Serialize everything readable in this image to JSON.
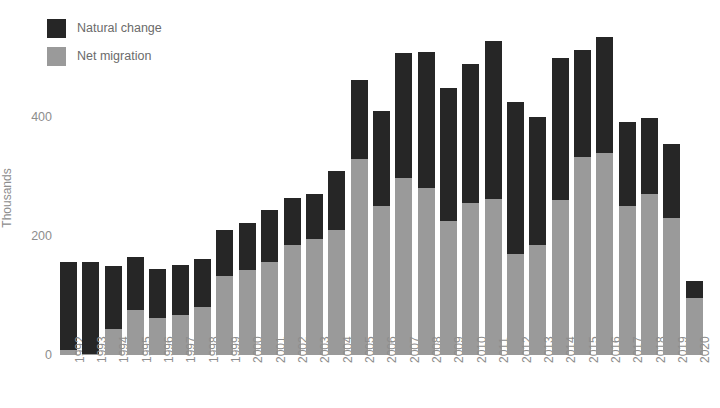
{
  "chart_data": {
    "type": "bar",
    "stacked": true,
    "title": "",
    "xlabel": "",
    "ylabel": "Thousands",
    "ylim": [
      0,
      560
    ],
    "yticks": [
      0,
      200,
      400
    ],
    "ytick_labels": [
      "0",
      "200",
      "400"
    ],
    "grid": false,
    "legend_position": "top-left",
    "categories": [
      "1992",
      "1993",
      "1994",
      "1995",
      "1996",
      "1997",
      "1998",
      "1999",
      "2000",
      "2001",
      "2002",
      "2003",
      "2004",
      "2005",
      "2006",
      "2007",
      "2008",
      "2009",
      "2010",
      "2011",
      "2012",
      "2013",
      "2014",
      "2015",
      "2016",
      "2017",
      "2018",
      "2019",
      "2020"
    ],
    "series": [
      {
        "name": "Net migration",
        "color": "#9a9a9a",
        "values": [
          8,
          2,
          44,
          76,
          62,
          68,
          80,
          133,
          143,
          156,
          185,
          195,
          210,
          330,
          250,
          298,
          280,
          226,
          256,
          262,
          170,
          185,
          260,
          332,
          340,
          250,
          270,
          230,
          95
        ]
      },
      {
        "name": "Natural change",
        "color": "#262626",
        "values": [
          149,
          155,
          105,
          89,
          82,
          83,
          82,
          77,
          79,
          87,
          79,
          75,
          100,
          132,
          160,
          210,
          230,
          222,
          233,
          265,
          255,
          215,
          240,
          180,
          195,
          142,
          128,
          125,
          30
        ]
      }
    ],
    "totals": [
      157,
      157,
      149,
      165,
      144,
      151,
      162,
      210,
      222,
      243,
      264,
      270,
      310,
      462,
      410,
      508,
      510,
      448,
      489,
      527,
      425,
      400,
      500,
      512,
      535,
      392,
      398,
      355,
      125
    ]
  },
  "legend": {
    "items": [
      {
        "label": "Natural change",
        "color": "#262626",
        "icon": "square-swatch-icon"
      },
      {
        "label": "Net migration",
        "color": "#9a9a9a",
        "icon": "square-swatch-icon"
      }
    ]
  }
}
